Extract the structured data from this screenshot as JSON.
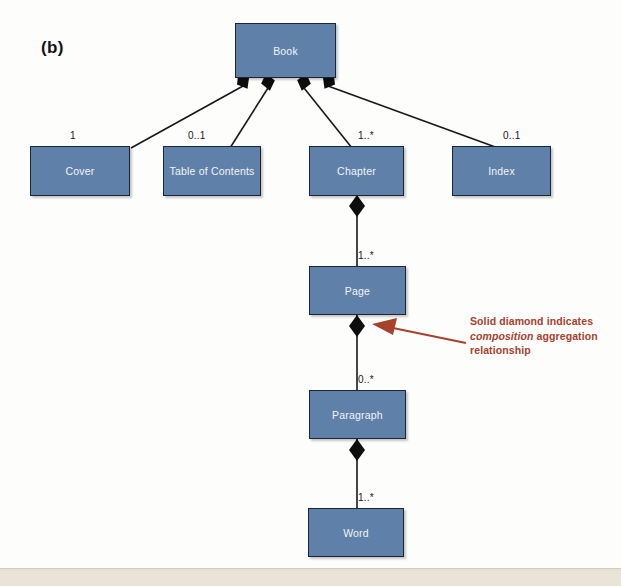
{
  "figure": {
    "panel_label": "(b)",
    "background_color": "#fdfdfc",
    "bottom_bar_color": "#e6e1d3"
  },
  "style": {
    "box_fill": "#5f80a8",
    "box_border": "#1c2535",
    "box_text_color": "#f2f4f7",
    "line_color": "#16181c",
    "diamond_color": "#0d0d0d",
    "annotation_color": "#a8412c"
  },
  "classes": [
    {
      "id": "book",
      "label": "Book",
      "x": 235,
      "y": 23,
      "w": 101,
      "h": 55
    },
    {
      "id": "cover",
      "label": "Cover",
      "x": 30,
      "y": 146,
      "w": 100,
      "h": 50
    },
    {
      "id": "toc",
      "label": "Table of Contents",
      "x": 163,
      "y": 146,
      "w": 98,
      "h": 50
    },
    {
      "id": "chapter",
      "label": "Chapter",
      "x": 309,
      "y": 146,
      "w": 95,
      "h": 50
    },
    {
      "id": "index",
      "label": "Index",
      "x": 452,
      "y": 146,
      "w": 99,
      "h": 50
    },
    {
      "id": "page",
      "label": "Page",
      "x": 309,
      "y": 266,
      "w": 97,
      "h": 49
    },
    {
      "id": "para",
      "label": "Paragraph",
      "x": 309,
      "y": 390,
      "w": 97,
      "h": 49
    },
    {
      "id": "word",
      "label": "Word",
      "x": 308,
      "y": 508,
      "w": 96,
      "h": 49
    }
  ],
  "relationships": [
    {
      "id": "book-cover",
      "from": "Book",
      "to": "Cover",
      "kind": "composition",
      "multiplicity": "1",
      "mx": 70,
      "my": 130
    },
    {
      "id": "book-toc",
      "from": "Book",
      "to": "Table of Contents",
      "kind": "composition",
      "multiplicity": "0..1",
      "mx": 188,
      "my": 130
    },
    {
      "id": "book-chapter",
      "from": "Book",
      "to": "Chapter",
      "kind": "composition",
      "multiplicity": "1..*",
      "mx": 358,
      "my": 130
    },
    {
      "id": "book-index",
      "from": "Book",
      "to": "Index",
      "kind": "composition",
      "multiplicity": "0..1",
      "mx": 503,
      "my": 130
    },
    {
      "id": "chapter-page",
      "from": "Chapter",
      "to": "Page",
      "kind": "composition",
      "multiplicity": "1..*",
      "mx": 358,
      "my": 250
    },
    {
      "id": "page-para",
      "from": "Page",
      "to": "Paragraph",
      "kind": "composition",
      "multiplicity": "0..*",
      "mx": 358,
      "my": 374
    },
    {
      "id": "para-word",
      "from": "Paragraph",
      "to": "Word",
      "kind": "composition",
      "multiplicity": "1..*",
      "mx": 358,
      "my": 492
    }
  ],
  "annotation": {
    "line1": "Solid diamond indicates",
    "emphasis": "composition",
    "line2_rest": " aggregation",
    "line3": "relationship",
    "arrow_color": "#a8412c"
  }
}
